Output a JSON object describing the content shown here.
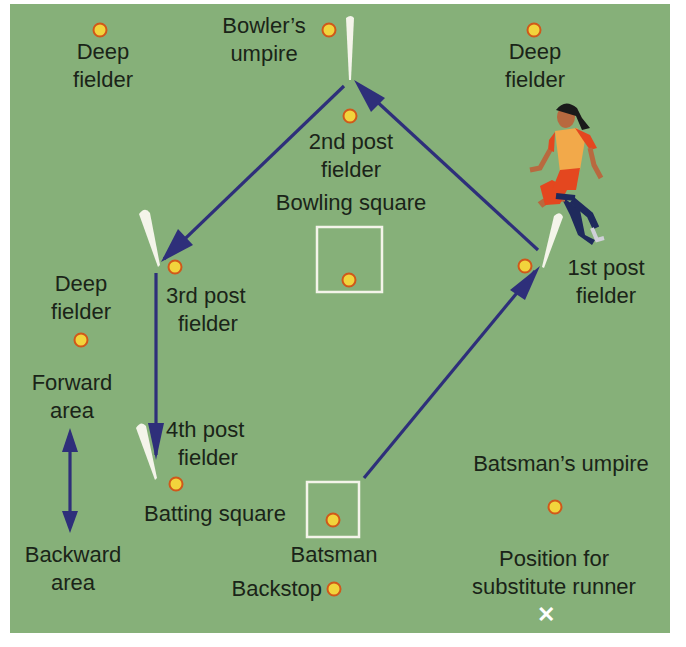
{
  "colors": {
    "field": "#86b079",
    "fielder_dot_fill": "#f2d43c",
    "fielder_dot_ring": "#d0581a",
    "arrow": "#2e2f7a",
    "post": "#f4f4ea",
    "square_outline": "#f4f4ea",
    "text": "#1a2418"
  },
  "labels": {
    "deep_fielder_top_left": [
      "Deep",
      "fielder"
    ],
    "bowlers_umpire": [
      "Bowler’s",
      "umpire"
    ],
    "deep_fielder_top_right": [
      "Deep",
      "fielder"
    ],
    "second_post_fielder": [
      "2nd post",
      "fielder"
    ],
    "bowling_square": "Bowling square",
    "deep_fielder_left": [
      "Deep",
      "fielder"
    ],
    "third_post_fielder": [
      "3rd post",
      "fielder"
    ],
    "first_post_fielder": [
      "1st post",
      "fielder"
    ],
    "forward_area": [
      "Forward",
      "area"
    ],
    "fourth_post_fielder": [
      "4th post",
      "fielder"
    ],
    "batting_square": "Batting square",
    "backward_area": [
      "Backward",
      "area"
    ],
    "batsman": "Batsman",
    "backstop": "Backstop",
    "batsmans_umpire": "Batsman’s umpire",
    "substitute_runner": [
      "Position for",
      "substitute runner"
    ]
  },
  "markers": {
    "substitute_runner_mark": "✕"
  },
  "icons": {
    "player": "running-player-illustration",
    "post": "post-marker",
    "fielder": "fielder-dot"
  }
}
